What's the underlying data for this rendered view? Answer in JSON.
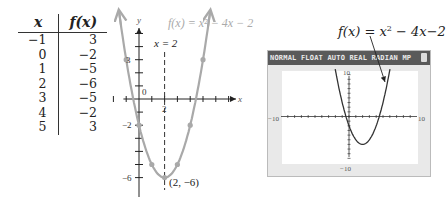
{
  "table": {
    "headers": [
      "x",
      "f(x)"
    ],
    "rows": [
      [
        "−1",
        "3"
      ],
      [
        "0",
        "−2"
      ],
      [
        "1",
        "−5"
      ],
      [
        "2",
        "−6"
      ],
      [
        "3",
        "−5"
      ],
      [
        "4",
        "−2"
      ],
      [
        "5",
        "3"
      ]
    ]
  },
  "chart_data": [
    {
      "type": "table",
      "columns": [
        "x",
        "f(x)"
      ],
      "x": [
        -1,
        0,
        1,
        2,
        3,
        4,
        5
      ],
      "y": [
        3,
        -2,
        -5,
        -6,
        -5,
        -2,
        3
      ]
    },
    {
      "type": "line",
      "title": "f(x) = x² − 4x − 2",
      "function": "x^2 - 4x - 2",
      "xlabel": "x",
      "ylabel": "y",
      "points": [
        [
          -1,
          3
        ],
        [
          0,
          -2
        ],
        [
          1,
          -5
        ],
        [
          2,
          -6
        ],
        [
          3,
          -5
        ],
        [
          4,
          -2
        ],
        [
          5,
          3
        ]
      ],
      "vertex": [
        2,
        -6
      ],
      "vertex_label": "(2, −6)",
      "axis_of_symmetry": "x = 2",
      "x_tick_labels": [
        "2"
      ],
      "y_tick_labels": [
        "3",
        "0",
        "−2",
        "−6"
      ],
      "xlim": [
        -2,
        7
      ],
      "ylim": [
        -7,
        6
      ],
      "curve_color": "#a9a9a9"
    },
    {
      "type": "line",
      "title": "f(x) = x² − 4x − 2",
      "xlim": [
        -10,
        10
      ],
      "ylim": [
        -10,
        10
      ],
      "x_tick_labels": [
        "−10",
        "10"
      ],
      "y_tick_labels": [
        "10",
        "−10"
      ],
      "curve_color": "#333333"
    }
  ],
  "graph": {
    "func_label": "f(x) = x² − 4x − 2",
    "axis_label": "x = 2",
    "vertex_label": "(2, −6)",
    "x_axis_label": "x",
    "y_axis_label": "y",
    "tick_2": "2",
    "tick_3": "3",
    "tick_0": "0",
    "tick_m2": "−2",
    "tick_m6": "−6"
  },
  "calculator": {
    "label_prefix": "f(x) = x",
    "label_exp": "2",
    "label_suffix": " − 4x−2",
    "status_bar": "NORMAL FLOAT AUTO REAL RADIAN MP",
    "x_min_label": "−10",
    "x_max_label": "10",
    "y_max_label": "10",
    "y_min_label": "−10"
  }
}
